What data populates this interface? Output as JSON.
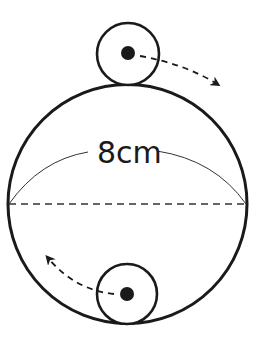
{
  "diagram": {
    "type": "geometry-rolling-circles",
    "large_circle": {
      "label": "8cm",
      "center": [
        127.5,
        204
      ],
      "radius": 119.5,
      "stroke": "#1a1a1a"
    },
    "small_circle_top": {
      "center": [
        128,
        54
      ],
      "radius": 31,
      "dot_radius": 7
    },
    "small_circle_bottom": {
      "center": [
        127,
        294
      ],
      "radius": 30,
      "dot_radius": 7
    },
    "diameter_line": {
      "style": "dashed"
    },
    "arc_label_line": {
      "style": "solid-thin"
    },
    "arrows": [
      {
        "name": "top-rotation-arrow",
        "direction": "clockwise",
        "style": "dashed"
      },
      {
        "name": "bottom-rotation-arrow",
        "direction": "counter-clockwise",
        "style": "dashed"
      }
    ],
    "colors": {
      "ink": "#1a1a1a",
      "background": "#ffffff"
    }
  }
}
